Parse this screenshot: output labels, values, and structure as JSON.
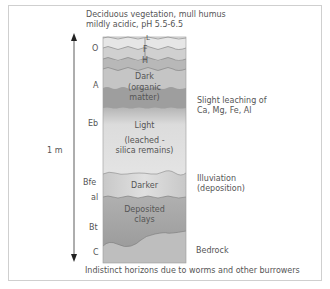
{
  "title": {
    "line1": "Deciduous vegetation, mull humus",
    "line2": "mildly acidic, pH 5.5-6.5"
  },
  "depth_scale": {
    "label": "1 m"
  },
  "horizons": [
    {
      "code": "O",
      "sublayers": [
        "L",
        "F",
        "H"
      ]
    },
    {
      "code": "A"
    },
    {
      "code": "Eb"
    },
    {
      "code": "Bfe"
    },
    {
      "code": "al"
    },
    {
      "code": "Bt"
    },
    {
      "code": "C"
    }
  ],
  "column_labels": {
    "sub_l": "L",
    "sub_f": "F",
    "sub_h": "H",
    "dark": "Dark",
    "organic1": "(organic",
    "organic2": "matter)",
    "light": "Light",
    "leached1": "(leached -",
    "leached2": "silica remains)",
    "darker": "Darker",
    "deposited1": "Deposited",
    "deposited2": "clays"
  },
  "annotations": {
    "leaching1": "Slight leaching of",
    "leaching2": "Ca, Mg, Fe, Al",
    "illuviation1": "Illuviation",
    "illuviation2": "(deposition)",
    "bedrock": "Bedrock"
  },
  "footer": "Indistinct horizons due to worms and other burrowers",
  "colors": {
    "layer_l": "#e6e6e6",
    "layer_f": "#cfcfcf",
    "layer_h": "#b7b7b7",
    "layer_a": "#c4c4c4",
    "layer_organic": "#9c9c9c",
    "layer_light": "#dadada",
    "layer_darker": "#bcbcbc",
    "layer_clay": "#a5a5a5",
    "layer_c": "#bdbdbd"
  }
}
